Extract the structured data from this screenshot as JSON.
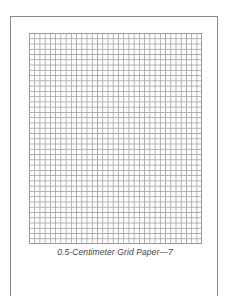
{
  "page": {
    "type": "worksheet",
    "caption": "0.5-Centimeter Grid Paper—7"
  },
  "grid": {
    "cell_size_label": "0.5-Centimeter",
    "columns": 33,
    "rows": 40,
    "line_color": "#a8a8a8",
    "border_color": "#9a9a9a"
  },
  "frame": {
    "border_color": "#8a8a8a"
  }
}
